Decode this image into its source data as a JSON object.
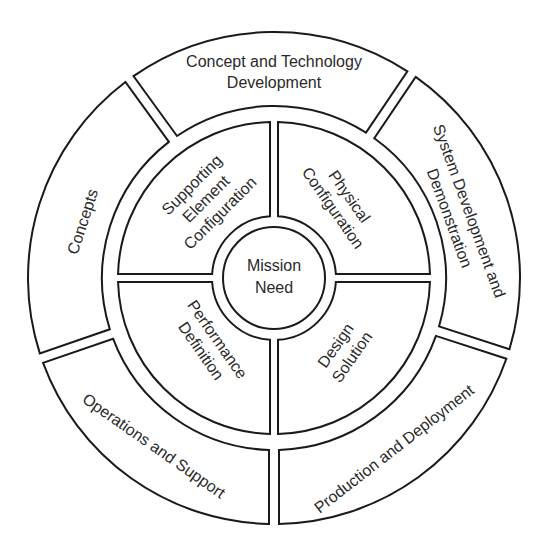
{
  "diagram": {
    "colors": {
      "stroke": "#1a1a1a",
      "fill": "#ffffff",
      "text": "#2a2a2a",
      "background": "#ffffff"
    },
    "geometry": {
      "cx": 274,
      "cy": 278,
      "outer_r_out": 246,
      "outer_r_in": 172,
      "quad_r_out": 156,
      "quad_r_in": 62,
      "center_r": 51,
      "outer_gap": 10,
      "quad_gap": 8
    },
    "center": {
      "lines": [
        "Mission",
        "Need"
      ],
      "x": 274,
      "y": 278,
      "rotate": 0
    },
    "outer_ring": [
      {
        "id": "concept-technology-development",
        "start": -36,
        "end": 34,
        "lines": [
          "Concept and Technology",
          "Development"
        ],
        "x": 274,
        "y": 73,
        "rotate": 0
      },
      {
        "id": "system-development-demonstration",
        "start": 34,
        "end": 108,
        "lines": [
          "System Development and",
          "Demonstration"
        ],
        "x": 458,
        "y": 215,
        "rotate": 70
      },
      {
        "id": "production-deployment",
        "start": 108,
        "end": 180,
        "lines": [
          "Production and Deployment"
        ],
        "x": 395,
        "y": 450,
        "rotate": -38
      },
      {
        "id": "operations-support",
        "start": 180,
        "end": 251,
        "lines": [
          "Operations and Support"
        ],
        "x": 153,
        "y": 447,
        "rotate": 35
      },
      {
        "id": "concepts",
        "start": 251,
        "end": 324,
        "lines": [
          "Concepts"
        ],
        "x": 84,
        "y": 222,
        "rotate": -72
      }
    ],
    "inner_ring": [
      {
        "id": "supporting-element-configuration",
        "start": -90,
        "end": 0,
        "lines": [
          "Supporting",
          "Element",
          "Configuration"
        ],
        "x": 207,
        "y": 200,
        "rotate": -45
      },
      {
        "id": "physical-configuration",
        "start": 0,
        "end": 90,
        "lines": [
          "Physical",
          "Configuration"
        ],
        "x": 340,
        "y": 203,
        "rotate": 55
      },
      {
        "id": "design-solution",
        "start": 90,
        "end": 180,
        "lines": [
          "Design",
          "Solution"
        ],
        "x": 345,
        "y": 352,
        "rotate": -55
      },
      {
        "id": "performance-definition",
        "start": 180,
        "end": 270,
        "lines": [
          "Performance",
          "Definition"
        ],
        "x": 208,
        "y": 346,
        "rotate": 55
      }
    ]
  }
}
